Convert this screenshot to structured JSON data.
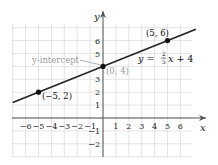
{
  "chart_data": {
    "type": "line",
    "title": "",
    "xlabel": "x",
    "ylabel": "y",
    "xlim": [
      -7,
      7.3
    ],
    "ylim": [
      -3,
      7.3
    ],
    "grid": true,
    "x_ticks": [
      -6,
      -5,
      -4,
      -3,
      -2,
      -1,
      1,
      2,
      3,
      4,
      5,
      6
    ],
    "x_tick_labels": [
      "−6",
      "−5",
      "−4",
      "−3",
      "−2",
      "−1",
      "1",
      "2",
      "3",
      "4",
      "5",
      "6"
    ],
    "y_ticks": [
      -2,
      -1,
      1,
      2,
      3,
      4,
      5,
      6
    ],
    "y_tick_labels": [
      "−2",
      "−1",
      "1",
      "2",
      "3",
      "4",
      "5",
      "6"
    ],
    "series": [
      {
        "name": "y = (2/5)x + 4",
        "equation": "y = 2/5 x + 4",
        "slope": 0.4,
        "intercept": 4,
        "x": [
          -7,
          7.2
        ],
        "y": [
          1.2,
          6.88
        ],
        "color": "#222222"
      }
    ],
    "points": [
      {
        "x": -5,
        "y": 2,
        "label": "(−5, 2)"
      },
      {
        "x": 0,
        "y": 4,
        "label": "(0, 4)"
      },
      {
        "x": 5,
        "y": 6,
        "label": "(5, 6)"
      }
    ],
    "annotations": [
      {
        "text": "y-intercept",
        "points_to": [
          0,
          4
        ],
        "color": "#9a9a9a"
      },
      {
        "text": "(0, 4)",
        "color": "#9a9a9a"
      },
      {
        "text": "y = 2/5 x + 4"
      }
    ]
  },
  "labels": {
    "x_axis": "x",
    "y_axis": "y",
    "y_intercept": "y-intercept",
    "intercept_point": "(0, 4)",
    "point_left": "(−5, 2)",
    "point_right": "(5, 6)",
    "eq_lhs": "y = ",
    "eq_num": "2",
    "eq_den": "5",
    "eq_rhs": "x + 4"
  },
  "colors": {
    "grid": "#d9d9d9",
    "axis": "#555555",
    "line": "#222222",
    "annotation": "#9a9a9a"
  }
}
